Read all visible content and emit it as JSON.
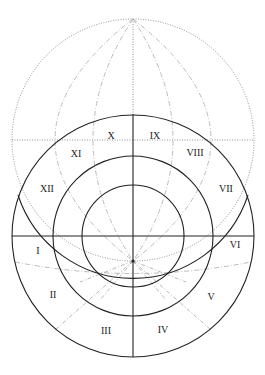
{
  "diagram": {
    "title": "",
    "colors": {
      "solid_line": "#222222",
      "dotted_line": "#777777",
      "dashed_line": "#aaaaaa",
      "background": "#ffffff"
    },
    "upper_sphere": {
      "cx": 133,
      "cy": 140,
      "r": 121,
      "style": "dotted"
    },
    "house_circles": [
      {
        "name": "outer",
        "cx": 133,
        "cy": 236,
        "r": 121
      },
      {
        "name": "middle",
        "cx": 133,
        "cy": 236,
        "r": 80
      },
      {
        "name": "inner",
        "cx": 133,
        "cy": 236,
        "r": 51
      }
    ],
    "focus_point": {
      "x": 133,
      "y": 261
    },
    "houses": [
      {
        "id": "house-1",
        "label": "I",
        "x": 38,
        "y": 252
      },
      {
        "id": "house-2",
        "label": "II",
        "x": 53,
        "y": 296
      },
      {
        "id": "house-3",
        "label": "III",
        "x": 106,
        "y": 332
      },
      {
        "id": "house-4",
        "label": "IV",
        "x": 163,
        "y": 331
      },
      {
        "id": "house-5",
        "label": "V",
        "x": 211,
        "y": 298
      },
      {
        "id": "house-6",
        "label": "VI",
        "x": 235,
        "y": 246
      },
      {
        "id": "house-7",
        "label": "VII",
        "x": 226,
        "y": 190
      },
      {
        "id": "house-8",
        "label": "VIII",
        "x": 195,
        "y": 154
      },
      {
        "id": "house-9",
        "label": "IX",
        "x": 155,
        "y": 137
      },
      {
        "id": "house-10",
        "label": "X",
        "x": 111,
        "y": 137
      },
      {
        "id": "house-11",
        "label": "XI",
        "x": 76,
        "y": 155
      },
      {
        "id": "house-12",
        "label": "XII",
        "x": 47,
        "y": 190
      }
    ]
  }
}
